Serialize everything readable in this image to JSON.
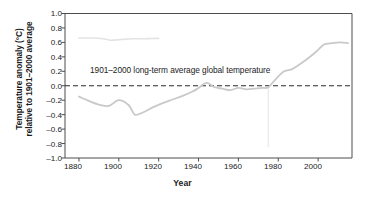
{
  "chart_data": {
    "type": "line",
    "title": "",
    "xlabel": "Year",
    "ylabel": "Temperature anomaly (°C) relative to 1901–2000 average",
    "ylabel_line1": "Temperature anomaly (°C)",
    "ylabel_line2": "relative to 1901–2000 average",
    "xlim": [
      1873,
      2017
    ],
    "ylim": [
      -1.0,
      1.0
    ],
    "grid": false,
    "legend": "none",
    "xticks": [
      1880,
      1900,
      1920,
      1940,
      1960,
      1980,
      2000
    ],
    "xtick_labels": [
      "1880",
      "1900",
      "1920",
      "1940",
      "1960",
      "1980",
      "2000"
    ],
    "yticks": [
      1.0,
      0.8,
      0.6,
      0.4,
      0.2,
      0.0,
      -0.2,
      -0.4,
      -0.6,
      -0.8,
      -1.0
    ],
    "ytick_labels": [
      "1.0",
      "0.8",
      "0.6",
      "0.4",
      "0.2",
      "0.0",
      "–0.2",
      "–0.4",
      "–0.6",
      "–0.8",
      "–1.0"
    ],
    "reference_line": {
      "value": 0.0,
      "style": "dashed",
      "label": "1901–2000 long-term average global temperature"
    },
    "series": [
      {
        "name": "Global temperature anomaly",
        "color": "#c9c9c9",
        "x": [
          1880,
          1885,
          1890,
          1895,
          1900,
          1905,
          1908,
          1912,
          1917,
          1922,
          1927,
          1932,
          1937,
          1940,
          1944,
          1948,
          1952,
          1956,
          1960,
          1964,
          1968,
          1972,
          1975,
          1979,
          1983,
          1987,
          1991,
          1995,
          1999,
          2003,
          2007,
          2011,
          2015
        ],
        "values": [
          -0.15,
          -0.21,
          -0.26,
          -0.28,
          -0.2,
          -0.27,
          -0.4,
          -0.37,
          -0.3,
          -0.24,
          -0.19,
          -0.14,
          -0.08,
          -0.03,
          0.04,
          -0.02,
          -0.04,
          -0.06,
          -0.03,
          -0.05,
          -0.04,
          -0.03,
          -0.02,
          0.1,
          0.2,
          0.23,
          0.3,
          0.38,
          0.47,
          0.57,
          0.59,
          0.6,
          0.59
        ]
      },
      {
        "name": "Upper faint trace",
        "color": "#e3e3e3",
        "x": [
          1880,
          1886,
          1892,
          1896,
          1901,
          1907,
          1912,
          1917,
          1920
        ],
        "values": [
          0.66,
          0.66,
          0.65,
          0.63,
          0.64,
          0.65,
          0.65,
          0.655,
          0.655
        ]
      }
    ],
    "artifacts": {
      "vertical_streak_year": 1975,
      "vertical_streak_from": 0.0,
      "vertical_streak_to": -0.85,
      "vertical_streak_color": "#ededed"
    },
    "colors": {
      "axis": "#4d4d4d",
      "line": "#c9c9c9",
      "reference": "#2a2a2a",
      "text": "#1b1b1b",
      "background": "#ffffff"
    }
  }
}
